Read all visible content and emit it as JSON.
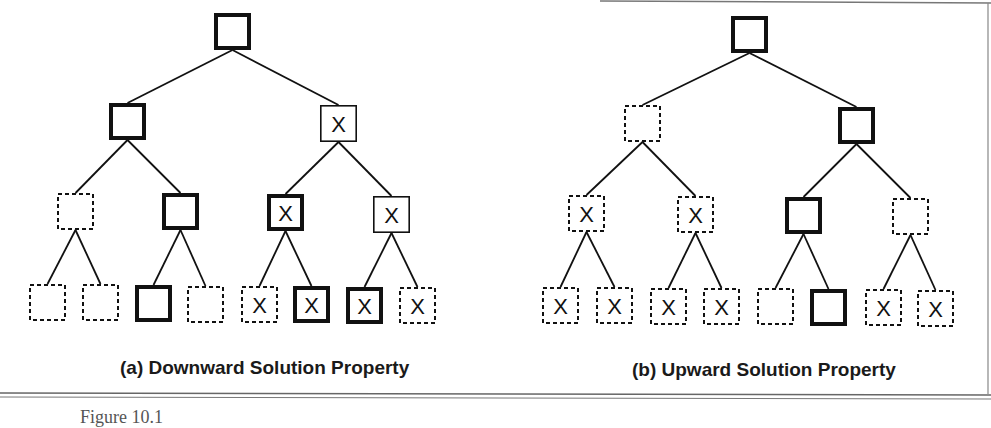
{
  "figure": {
    "colors": {
      "ink": "#111111",
      "frame": "#777777",
      "background": "#ffffff"
    },
    "trees": [
      {
        "id": "a",
        "caption": "(a) Downward Solution Property",
        "caption_pos": [
          120,
          369
        ],
        "nodes": [
          {
            "id": "r",
            "x": 214,
            "y": 13,
            "style": "thick",
            "mark": ""
          },
          {
            "id": "L",
            "x": 109,
            "y": 103,
            "style": "thick",
            "mark": ""
          },
          {
            "id": "R",
            "x": 320,
            "y": 105,
            "style": "thin",
            "mark": "X"
          },
          {
            "id": "LL",
            "x": 57,
            "y": 193,
            "style": "dashed",
            "mark": ""
          },
          {
            "id": "LR",
            "x": 162,
            "y": 193,
            "style": "thick",
            "mark": ""
          },
          {
            "id": "RL",
            "x": 267,
            "y": 194,
            "style": "thick",
            "mark": "X"
          },
          {
            "id": "RR",
            "x": 373,
            "y": 196,
            "style": "thin",
            "mark": "X"
          },
          {
            "id": "LLL",
            "x": 29,
            "y": 284,
            "style": "dashed",
            "mark": ""
          },
          {
            "id": "LLR",
            "x": 82,
            "y": 284,
            "style": "dashed",
            "mark": ""
          },
          {
            "id": "LRL",
            "x": 135,
            "y": 285,
            "style": "thick",
            "mark": ""
          },
          {
            "id": "LRR",
            "x": 187,
            "y": 286,
            "style": "dashed",
            "mark": ""
          },
          {
            "id": "RLL",
            "x": 241,
            "y": 286,
            "style": "dashed",
            "mark": "X"
          },
          {
            "id": "RLR",
            "x": 293,
            "y": 286,
            "style": "thick",
            "mark": "X"
          },
          {
            "id": "RRL",
            "x": 346,
            "y": 287,
            "style": "thick",
            "mark": "X"
          },
          {
            "id": "RRR",
            "x": 399,
            "y": 287,
            "style": "dashed",
            "mark": "X"
          }
        ],
        "edges": [
          [
            "r",
            "L"
          ],
          [
            "r",
            "R"
          ],
          [
            "L",
            "LL"
          ],
          [
            "L",
            "LR"
          ],
          [
            "R",
            "RL"
          ],
          [
            "R",
            "RR"
          ],
          [
            "LL",
            "LLL"
          ],
          [
            "LL",
            "LLR"
          ],
          [
            "LR",
            "LRL"
          ],
          [
            "LR",
            "LRR"
          ],
          [
            "RL",
            "RLL"
          ],
          [
            "RL",
            "RLR"
          ],
          [
            "RR",
            "RRL"
          ],
          [
            "RR",
            "RRR"
          ]
        ]
      },
      {
        "id": "b",
        "caption": "(b) Upward Solution Property",
        "caption_pos": [
          632,
          371
        ],
        "nodes": [
          {
            "id": "r",
            "x": 731,
            "y": 16,
            "style": "thick",
            "mark": ""
          },
          {
            "id": "L",
            "x": 624,
            "y": 105,
            "style": "dashed",
            "mark": ""
          },
          {
            "id": "R",
            "x": 838,
            "y": 107,
            "style": "thick",
            "mark": ""
          },
          {
            "id": "LL",
            "x": 568,
            "y": 195,
            "style": "dashed",
            "mark": "X"
          },
          {
            "id": "LR",
            "x": 677,
            "y": 196,
            "style": "dashed",
            "mark": "X"
          },
          {
            "id": "RL",
            "x": 785,
            "y": 197,
            "style": "thick",
            "mark": ""
          },
          {
            "id": "RR",
            "x": 892,
            "y": 198,
            "style": "dashed",
            "mark": ""
          },
          {
            "id": "LLL",
            "x": 542,
            "y": 287,
            "style": "dashed",
            "mark": "X"
          },
          {
            "id": "LLR",
            "x": 596,
            "y": 287,
            "style": "dashed",
            "mark": "X"
          },
          {
            "id": "LRL",
            "x": 650,
            "y": 288,
            "style": "dashed",
            "mark": "X"
          },
          {
            "id": "LRR",
            "x": 703,
            "y": 288,
            "style": "dashed",
            "mark": "X"
          },
          {
            "id": "RLL",
            "x": 757,
            "y": 288,
            "style": "dashed",
            "mark": ""
          },
          {
            "id": "RLR",
            "x": 810,
            "y": 289,
            "style": "thick",
            "mark": ""
          },
          {
            "id": "RRL",
            "x": 865,
            "y": 289,
            "style": "dashed",
            "mark": "X"
          },
          {
            "id": "RRR",
            "x": 917,
            "y": 290,
            "style": "dashed",
            "mark": "X"
          }
        ],
        "edges": [
          [
            "r",
            "L"
          ],
          [
            "r",
            "R"
          ],
          [
            "L",
            "LL"
          ],
          [
            "L",
            "LR"
          ],
          [
            "R",
            "RL"
          ],
          [
            "R",
            "RR"
          ],
          [
            "LL",
            "LLL"
          ],
          [
            "LL",
            "LLR"
          ],
          [
            "LR",
            "LRL"
          ],
          [
            "LR",
            "LRR"
          ],
          [
            "RL",
            "RLL"
          ],
          [
            "RL",
            "RLR"
          ],
          [
            "RR",
            "RRL"
          ],
          [
            "RR",
            "RRR"
          ]
        ]
      }
    ],
    "node_size": 37,
    "legend_semantics": {
      "thick": "solution node",
      "thin": "non-solution node",
      "dashed": "unvisited / pruned node",
      "X": "infeasible node"
    },
    "bottom_caption_partial": "Figure 10.1"
  }
}
